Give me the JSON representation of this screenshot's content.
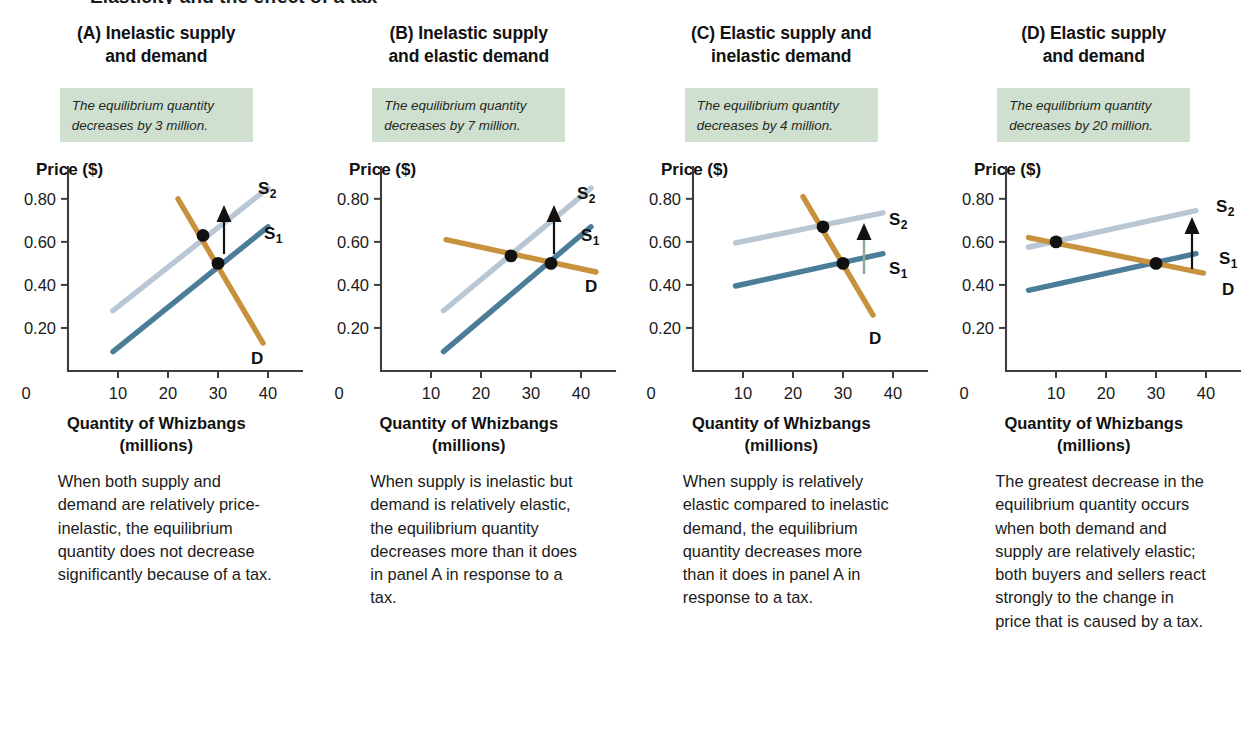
{
  "figure": {
    "running_title": "Elasticity and the effect of a tax",
    "x_axis_caption_line1": "Quantity of Whizbangs",
    "x_axis_caption_line2": "(millions)",
    "y_axis_title": "Price ($)",
    "origin_label": "0",
    "x_ticks": [
      "10",
      "20",
      "30",
      "40"
    ],
    "y_ticks": [
      "0.20",
      "0.40",
      "0.60",
      "0.80"
    ],
    "curve_labels": {
      "s1": "S",
      "s1_sub": "1",
      "s2": "S",
      "s2_sub": "2",
      "d": "D"
    },
    "colors": {
      "supply_1": "#4b7d99",
      "supply_2": "#b9c7d5",
      "demand": "#c8913c",
      "callout_bg": "#cfdfd0",
      "axis": "#3d3d3d",
      "point": "#111111",
      "arrow_black": "#111111",
      "arrow_green": "#8fa894"
    }
  },
  "panels": [
    {
      "id": "A",
      "heading_line1": "(A) Inelastic supply",
      "heading_line2": "and demand",
      "callout": "The equilibrium quantity decreases by 3 million.",
      "body": "When both supply and demand are relatively price-inelastic, the equilibrium quantity does not decrease significantly because of a tax.",
      "arrow_color": "#111111"
    },
    {
      "id": "B",
      "heading_line1": "(B) Inelastic supply",
      "heading_line2": "and elastic demand",
      "callout": "The equilibrium quantity decreases by 7 million.",
      "body": "When supply is inelastic but demand is relatively elastic, the equilibrium quantity decreases more than it does in panel A in response to a tax.",
      "arrow_color": "#111111"
    },
    {
      "id": "C",
      "heading_line1": "(C) Elastic supply and",
      "heading_line2": "inelastic demand",
      "callout": "The equilibrium quantity decreases by 4 million.",
      "body": "When supply is relatively elastic compared to inelastic demand, the equilibrium quantity decreases more than it does in panel A in response to a tax.",
      "arrow_color": "#8fa894"
    },
    {
      "id": "D",
      "heading_line1": "(D) Elastic supply",
      "heading_line2": "and demand",
      "callout": "The equilibrium quantity decreases by 20 million.",
      "body": "The greatest decrease in the equilibrium quantity occurs when both demand and supply are relatively elastic; both buyers and sellers react strongly to the change in price that is caused by a tax.",
      "arrow_color": "#111111"
    }
  ],
  "chart_data": [
    {
      "type": "line",
      "panel": "A",
      "title": "(A) Inelastic supply and demand",
      "xlabel": "Quantity of Whizbangs (millions)",
      "ylabel": "Price ($)",
      "xlim": [
        0,
        46
      ],
      "ylim": [
        0,
        0.92
      ],
      "grid": false,
      "series": [
        {
          "name": "S1",
          "points": [
            [
              9,
              0.09
            ],
            [
              40,
              0.67
            ]
          ]
        },
        {
          "name": "S2",
          "points": [
            [
              9,
              0.28
            ],
            [
              40,
              0.85
            ]
          ]
        },
        {
          "name": "D",
          "points": [
            [
              22,
              0.8
            ],
            [
              39,
              0.13
            ]
          ]
        }
      ],
      "equilibria": [
        {
          "label": "new",
          "quantity": 27,
          "price": 0.63
        },
        {
          "label": "original",
          "quantity": 30,
          "price": 0.5
        }
      ],
      "quantity_decrease_millions": 3
    },
    {
      "type": "line",
      "panel": "B",
      "title": "(B) Inelastic supply and elastic demand",
      "xlabel": "Quantity of Whizbangs (millions)",
      "ylabel": "Price ($)",
      "xlim": [
        0,
        46
      ],
      "ylim": [
        0,
        0.92
      ],
      "grid": false,
      "series": [
        {
          "name": "S1",
          "points": [
            [
              12.5,
              0.09
            ],
            [
              42,
              0.67
            ]
          ]
        },
        {
          "name": "S2",
          "points": [
            [
              12.5,
              0.28
            ],
            [
              42,
              0.85
            ]
          ]
        },
        {
          "name": "D",
          "points": [
            [
              13,
              0.61
            ],
            [
              43,
              0.46
            ]
          ]
        }
      ],
      "equilibria": [
        {
          "label": "new",
          "quantity": 26,
          "price": 0.535
        },
        {
          "label": "original",
          "quantity": 34,
          "price": 0.5
        }
      ],
      "quantity_decrease_millions": 7
    },
    {
      "type": "line",
      "panel": "C",
      "title": "(C) Elastic supply and inelastic demand",
      "xlabel": "Quantity of Whizbangs (millions)",
      "ylabel": "Price ($)",
      "xlim": [
        0,
        46
      ],
      "ylim": [
        0,
        0.92
      ],
      "grid": false,
      "series": [
        {
          "name": "S1",
          "points": [
            [
              8.5,
              0.395
            ],
            [
              38,
              0.545
            ]
          ]
        },
        {
          "name": "S2",
          "points": [
            [
              8.5,
              0.595
            ],
            [
              38,
              0.735
            ]
          ]
        },
        {
          "name": "D",
          "points": [
            [
              22,
              0.81
            ],
            [
              36,
              0.26
            ]
          ]
        }
      ],
      "equilibria": [
        {
          "label": "new",
          "quantity": 26,
          "price": 0.67
        },
        {
          "label": "original",
          "quantity": 30,
          "price": 0.5
        }
      ],
      "quantity_decrease_millions": 4
    },
    {
      "type": "line",
      "panel": "D",
      "title": "(D) Elastic supply and demand",
      "xlabel": "Quantity of Whizbangs (millions)",
      "ylabel": "Price ($)",
      "xlim": [
        0,
        46
      ],
      "ylim": [
        0,
        0.92
      ],
      "grid": false,
      "series": [
        {
          "name": "S1",
          "points": [
            [
              4.5,
              0.375
            ],
            [
              38,
              0.545
            ]
          ]
        },
        {
          "name": "S2",
          "points": [
            [
              4.5,
              0.575
            ],
            [
              38,
              0.745
            ]
          ]
        },
        {
          "name": "D",
          "points": [
            [
              4.5,
              0.62
            ],
            [
              39.5,
              0.455
            ]
          ]
        }
      ],
      "equilibria": [
        {
          "label": "new",
          "quantity": 10,
          "price": 0.6
        },
        {
          "label": "original",
          "quantity": 30,
          "price": 0.5
        }
      ],
      "quantity_decrease_millions": 20
    }
  ]
}
